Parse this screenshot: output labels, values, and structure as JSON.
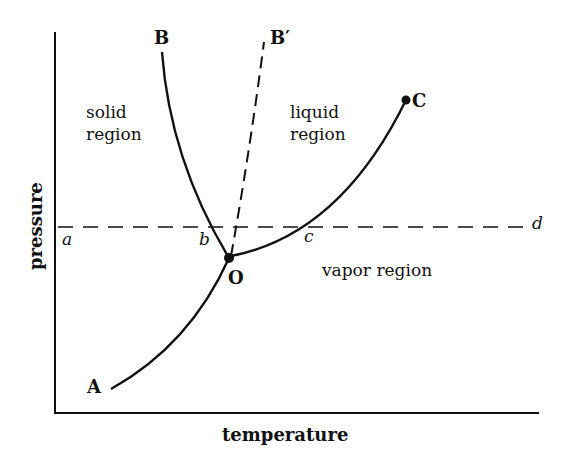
{
  "diagram": {
    "type": "phase-diagram",
    "axes": {
      "xlabel": "temperature",
      "ylabel": "pressure"
    },
    "regions": {
      "solid": [
        "solid",
        "region"
      ],
      "liquid": [
        "liquid",
        "region"
      ],
      "vapor": "vapor region"
    },
    "points": {
      "A": "A",
      "B": "B",
      "B_prime": "B′",
      "C": "C",
      "O": "O"
    },
    "isobar_labels": {
      "a": "a",
      "b": "b",
      "c": "c",
      "d": "d"
    },
    "curves": [
      {
        "name": "sublimation-curve",
        "from": "A",
        "to": "O",
        "style": "solid"
      },
      {
        "name": "fusion-curve",
        "from": "O",
        "to": "B",
        "style": "solid"
      },
      {
        "name": "fusion-curve-alt",
        "from": "O",
        "to": "B′",
        "style": "dashed"
      },
      {
        "name": "vaporization-curve",
        "from": "O",
        "to": "C",
        "style": "solid"
      },
      {
        "name": "isobar",
        "from": "a",
        "to": "d",
        "style": "dashed"
      }
    ],
    "colors": {
      "ink": "#111111",
      "background": "#ffffff"
    }
  }
}
